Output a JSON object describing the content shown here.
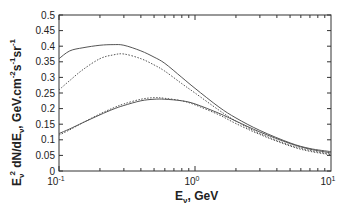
{
  "chart_data": {
    "type": "line",
    "title": "",
    "xlabel": "E_ν, GeV",
    "ylabel": "E_ν² dN/dE_ν,  GeV.cm⁻²s⁻¹sr⁻¹",
    "xscale": "log",
    "xlim": [
      0.1,
      10
    ],
    "ylim": [
      0,
      0.5
    ],
    "grid": false,
    "legend": null,
    "x_ticks": [
      {
        "value": 0.1,
        "base": "10",
        "exp": "-1"
      },
      {
        "value": 1,
        "base": "10",
        "exp": "0"
      },
      {
        "value": 10,
        "base": "10",
        "exp": "1"
      }
    ],
    "y_ticks": [
      "0",
      "0.05",
      "0.1",
      "0.15",
      "0.2",
      "0.25",
      "0.3",
      "0.35",
      "0.4",
      "0.45",
      "0.5"
    ],
    "x": [
      0.1,
      0.12,
      0.15,
      0.2,
      0.25,
      0.3,
      0.4,
      0.5,
      0.6,
      0.8,
      1,
      1.5,
      2,
      3,
      5,
      7,
      10
    ],
    "series": [
      {
        "name": "upper-solid",
        "style": "solid",
        "values": [
          0.36,
          0.385,
          0.395,
          0.403,
          0.405,
          0.403,
          0.385,
          0.365,
          0.345,
          0.3,
          0.265,
          0.205,
          0.17,
          0.13,
          0.09,
          0.072,
          0.062
        ]
      },
      {
        "name": "upper-dotted",
        "style": "dotted",
        "values": [
          0.26,
          0.29,
          0.325,
          0.36,
          0.372,
          0.375,
          0.36,
          0.34,
          0.32,
          0.28,
          0.25,
          0.195,
          0.16,
          0.12,
          0.083,
          0.066,
          0.054
        ]
      },
      {
        "name": "lower-solid",
        "style": "solid",
        "values": [
          0.12,
          0.135,
          0.155,
          0.18,
          0.198,
          0.21,
          0.225,
          0.23,
          0.23,
          0.225,
          0.215,
          0.185,
          0.16,
          0.125,
          0.088,
          0.07,
          0.058
        ]
      },
      {
        "name": "lower-dotted",
        "style": "dotted",
        "values": [
          0.115,
          0.132,
          0.155,
          0.183,
          0.202,
          0.215,
          0.23,
          0.235,
          0.233,
          0.225,
          0.212,
          0.18,
          0.152,
          0.117,
          0.08,
          0.063,
          0.052
        ]
      }
    ]
  },
  "labels": {
    "x_main": "E",
    "x_sub": "ν",
    "x_unit": ", GeV",
    "y_e": "E",
    "y_sub1": "ν",
    "y_sup1": "2",
    "y_mid": " dN/dE",
    "y_sub2": "ν",
    "y_unit": ",  GeV.cm",
    "y_sup2": "-2",
    "y_s": "s",
    "y_sup3": "-1",
    "y_sr": "sr",
    "y_sup4": "-1"
  },
  "colors": {
    "axis": "#333333",
    "line": "#555555"
  }
}
